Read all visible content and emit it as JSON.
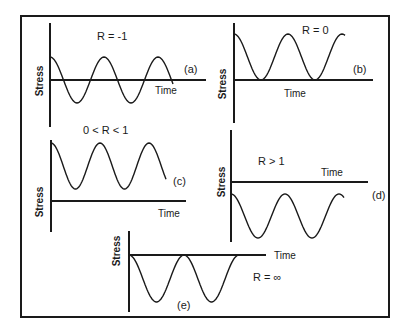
{
  "figure": {
    "frame": {
      "x": 21,
      "y": 16,
      "w": 368,
      "h": 301
    },
    "ylabel": "Stress",
    "xlabel": "Time"
  },
  "panels": [
    {
      "id": "a",
      "tag": "(a)",
      "r_label": "R = -1",
      "y_axis": {
        "x": 50,
        "y1": 23,
        "y2": 127
      },
      "time_axis": {
        "y": 80,
        "x1": 50,
        "x2": 206
      },
      "wave": {
        "x0": 50,
        "x1": 173,
        "period": 54,
        "mid": 80,
        "amp": 23,
        "phase": "peak"
      },
      "stress_pos": {
        "x": 40,
        "y": 81
      },
      "time_pos": {
        "x": 155,
        "y": 94
      },
      "r_pos": {
        "x": 97,
        "y": 40
      },
      "tag_pos": {
        "x": 184,
        "y": 73
      }
    },
    {
      "id": "b",
      "tag": "(b)",
      "r_label": "R = 0",
      "y_axis": {
        "x": 234,
        "y1": 23,
        "y2": 123
      },
      "time_axis": {
        "y": 80,
        "x1": 234,
        "x2": 373
      },
      "wave": {
        "x0": 234,
        "x1": 345,
        "period": 54,
        "mid": 57,
        "amp": 23,
        "phase": "peak"
      },
      "stress_pos": {
        "x": 223,
        "y": 84
      },
      "time_pos": {
        "x": 284,
        "y": 97
      },
      "r_pos": {
        "x": 302,
        "y": 34
      },
      "tag_pos": {
        "x": 353,
        "y": 73
      }
    },
    {
      "id": "c",
      "tag": "(c)",
      "r_label": "0 < R < 1",
      "y_axis": {
        "x": 51,
        "y1": 140,
        "y2": 232
      },
      "time_axis": {
        "y": 201,
        "x1": 51,
        "x2": 186
      },
      "wave": {
        "x0": 51,
        "x1": 166,
        "period": 49,
        "mid": 166,
        "amp": 23,
        "phase": "peak"
      },
      "stress_pos": {
        "x": 40,
        "y": 202
      },
      "time_pos": {
        "x": 158,
        "y": 217
      },
      "r_pos": {
        "x": 83,
        "y": 134
      },
      "tag_pos": {
        "x": 173,
        "y": 185
      }
    },
    {
      "id": "d",
      "tag": "(d)",
      "r_label": "R > 1",
      "y_axis": {
        "x": 231,
        "y1": 130,
        "y2": 242
      },
      "time_axis": {
        "y": 182,
        "x1": 231,
        "x2": 368
      },
      "wave": {
        "x0": 231,
        "x1": 344,
        "period": 54,
        "mid": 216,
        "amp": 22,
        "phase": "peak"
      },
      "stress_pos": {
        "x": 222,
        "y": 182
      },
      "time_pos": {
        "x": 321,
        "y": 176
      },
      "r_pos": {
        "x": 258,
        "y": 165
      },
      "tag_pos": {
        "x": 372,
        "y": 199
      }
    },
    {
      "id": "e",
      "tag": "(e)",
      "r_label": "R = ∞",
      "y_axis": {
        "x": 129,
        "y1": 231,
        "y2": 312
      },
      "time_axis": {
        "y": 255,
        "x1": 129,
        "x2": 266
      },
      "wave": {
        "x0": 129,
        "x1": 240,
        "period": 55,
        "mid": 278.5,
        "amp": 23.5,
        "phase": "peak"
      },
      "stress_pos": {
        "x": 117,
        "y": 251
      },
      "time_pos": {
        "x": 274,
        "y": 259
      },
      "r_pos": {
        "x": 253,
        "y": 281
      },
      "tag_pos": {
        "x": 177,
        "y": 309
      }
    }
  ]
}
